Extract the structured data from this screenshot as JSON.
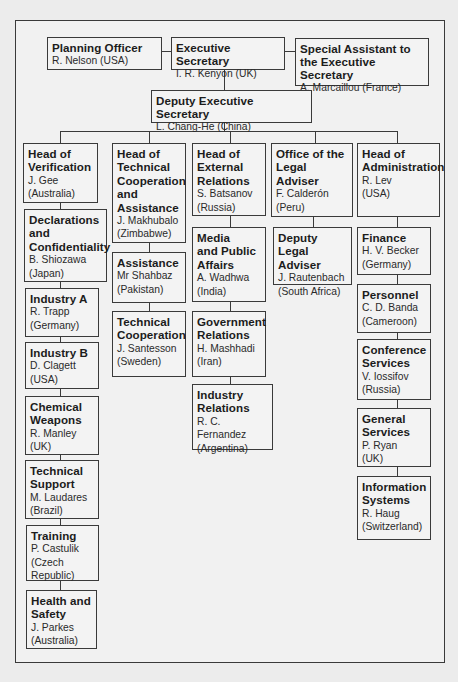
{
  "chart_title": "",
  "top": {
    "planning_officer": {
      "title": "Planning Officer",
      "name": "R. Nelson (USA)"
    },
    "executive_secretary": {
      "title": "Executive Secretary",
      "name": "I. R. Kenyon (UK)"
    },
    "special_assistant": {
      "title": "Special Assistant to\nthe Executive Secretary",
      "name": "A. Marcaillou (France)"
    },
    "deputy_executive_secretary": {
      "title": "Deputy Executive Secretary",
      "name": "L. Chang-He (China)"
    }
  },
  "columns": [
    {
      "head": {
        "title": "Head of\nVerification",
        "name": "J. Gee\n(Australia)"
      },
      "units": [
        {
          "title": "Declarations\nand\nConfidentiality",
          "name": "B. Shiozawa\n(Japan)"
        },
        {
          "title": "Industry A",
          "name": "R. Trapp\n(Germany)"
        },
        {
          "title": "Industry B",
          "name": "D. Clagett\n(USA)"
        },
        {
          "title": "Chemical\nWeapons",
          "name": "R. Manley\n(UK)"
        },
        {
          "title": "Technical\nSupport",
          "name": "M. Laudares\n(Brazil)"
        },
        {
          "title": "Training",
          "name": "P. Castulik\n(Czech\nRepublic)"
        },
        {
          "title": "Health and\nSafety",
          "name": "J. Parkes\n(Australia)"
        }
      ]
    },
    {
      "head": {
        "title": "Head of\nTechnical\nCooperation\nand\nAssistance",
        "name": "J. Makhubalo\n(Zimbabwe)"
      },
      "units": [
        {
          "title": "Assistance",
          "name": "Mr Shahbaz\n(Pakistan)"
        },
        {
          "title": "Technical\nCooperation",
          "name": "J. Santesson\n(Sweden)"
        }
      ]
    },
    {
      "head": {
        "title": "Head of\nExternal\nRelations",
        "name": "S. Batsanov\n(Russia)"
      },
      "units": [
        {
          "title": "Media\nand Public\nAffairs",
          "name": "A. Wadhwa\n(India)"
        },
        {
          "title": "Government\nRelations",
          "name": "H. Mashhadi\n(Iran)"
        },
        {
          "title": "Industry\nRelations",
          "name": "R. C. Fernandez\n(Argentina)"
        }
      ]
    },
    {
      "head": {
        "title": "Office of the\nLegal Adviser",
        "name": "F. Calderón\n(Peru)"
      },
      "units": [
        {
          "title": "Deputy\nLegal Adviser",
          "name": "J. Rautenbach\n(South Africa)"
        }
      ]
    },
    {
      "head": {
        "title": "Head of\nAdministration",
        "name": "R. Lev\n(USA)"
      },
      "units": [
        {
          "title": "Finance",
          "name": "H. V. Becker\n(Germany)"
        },
        {
          "title": "Personnel",
          "name": "C. D. Banda\n(Cameroon)"
        },
        {
          "title": "Conference\nServices",
          "name": "V. Iossifov\n(Russia)"
        },
        {
          "title": "General\nServices",
          "name": "P. Ryan\n(UK)"
        },
        {
          "title": "Information\nSystems",
          "name": "R. Haug\n(Switzerland)"
        }
      ]
    }
  ],
  "colors": {
    "line": "#3a3a3a",
    "background": "#ececec",
    "box": "#f3f3f3"
  }
}
